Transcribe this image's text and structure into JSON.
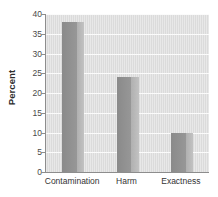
{
  "chart_data": {
    "type": "bar",
    "title": "",
    "subtitle": "",
    "xlabel": "",
    "ylabel": "Percent",
    "categories": [
      "Contamination",
      "Harm",
      "Exactness"
    ],
    "values": [
      38,
      24,
      10
    ],
    "series": [
      {
        "name": "Percent",
        "values": [
          38,
          24,
          10
        ]
      }
    ],
    "ylim": [
      0,
      40
    ],
    "ytick_step": 5,
    "ytick_labels": [
      "0",
      "5",
      "10",
      "15",
      "20",
      "25",
      "30",
      "35",
      "40"
    ],
    "ytick_values": [
      0,
      5,
      10,
      15,
      20,
      25,
      30,
      35,
      40
    ],
    "grid": "horizontal",
    "legend": "none",
    "colors": {
      "bar_face": "#8f8f8f",
      "bar_side": "#b5b5b5",
      "plot_background": "#dedede",
      "gridline": "#fbfbfb",
      "axis_line": "#8d8d8d",
      "text": "#333333",
      "page_background": "#ffffff"
    }
  }
}
